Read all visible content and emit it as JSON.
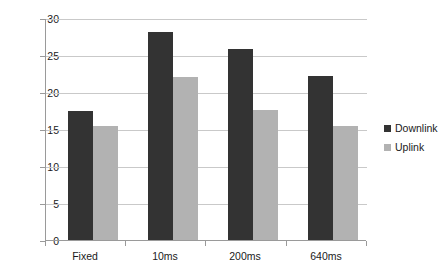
{
  "chart_data": {
    "type": "bar",
    "title": "",
    "subtitle": "",
    "xlabel": "",
    "ylabel": "",
    "categories": [
      "Fixed",
      "10ms",
      "200ms",
      "640ms"
    ],
    "series": [
      {
        "name": "Downlink",
        "color": "#333333",
        "values": [
          17.5,
          28.1,
          25.8,
          22.2
        ]
      },
      {
        "name": "Uplink",
        "color": "#b2b2b2",
        "values": [
          15.4,
          22.0,
          17.6,
          15.4
        ]
      }
    ],
    "ylim": [
      0,
      30
    ],
    "ytick_labels": [
      "0",
      "5",
      "10",
      "15",
      "20",
      "25",
      "30"
    ],
    "ytick_values": [
      0,
      5,
      10,
      15,
      20,
      25,
      30
    ],
    "grid": true,
    "grid_axis": "y",
    "legend_position": "right",
    "legend_entries": [
      "Downlink",
      "Uplink"
    ]
  }
}
